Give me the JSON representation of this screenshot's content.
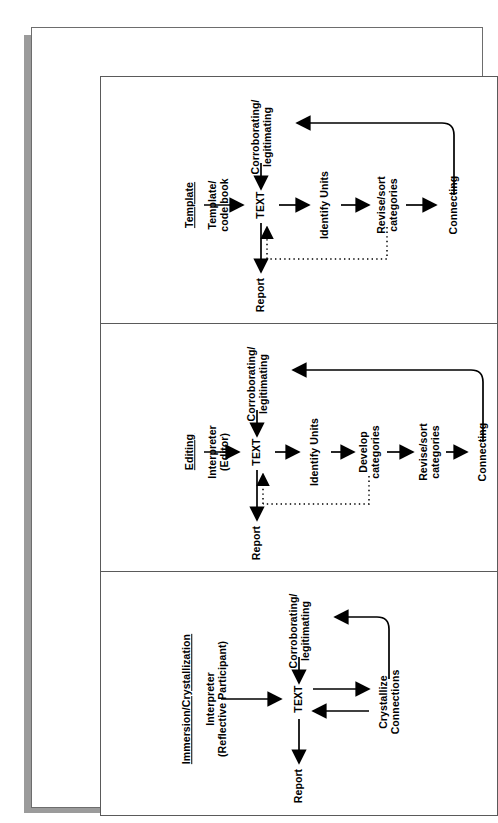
{
  "figure": {
    "orientation": "rotated-90-ccw",
    "background": "#ffffff",
    "line_color": "#000000",
    "frame_color": "#6d6d6d",
    "shadow_color": "#9b9b9b"
  },
  "panels": [
    {
      "id": "template",
      "heading": "Template",
      "source": "Template/\ncode book",
      "text_node": "TEXT",
      "top_node": "Corroborating/\nlegitimating",
      "bottom_node": "Report",
      "steps": [
        "Identify Units",
        "Revise/sort\ncategories",
        "Connecting"
      ],
      "feedback_dotted": true,
      "return_curve": true
    },
    {
      "id": "editing",
      "heading": "Editing",
      "source": "Interpreter\n(Editor)",
      "text_node": "TEXT",
      "top_node": "Corroborating/\nlegitimating",
      "bottom_node": "Report",
      "steps": [
        "Identify Units",
        "Develop\ncategories",
        "Revise/sort\ncategories",
        "Connecting"
      ],
      "feedback_dotted": true,
      "return_curve": true
    },
    {
      "id": "immersion",
      "heading": "Immersion/Crystallization",
      "source": "Interpreter\n(Reflective Participant)",
      "text_node": "TEXT",
      "top_node": "Corroborating/\nlegitimating",
      "bottom_node": "Report",
      "steps": [
        "Crystallize\nConnections"
      ],
      "feedback_dotted": false,
      "return_curve": true,
      "bidirectional": true
    }
  ]
}
